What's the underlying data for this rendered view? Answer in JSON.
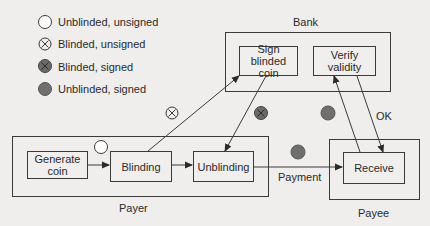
{
  "legend": {
    "items": [
      {
        "symbol": "open-circle",
        "label": "Unblinded, unsigned"
      },
      {
        "symbol": "x-circle",
        "label": "Blinded, unsigned"
      },
      {
        "symbol": "dark-x-circle",
        "label": "Blinded, signed"
      },
      {
        "symbol": "dark-circle",
        "label": "Unblinded, signed"
      }
    ]
  },
  "groups": {
    "bank": {
      "label": "Bank"
    },
    "payer": {
      "label": "Payer"
    },
    "payee": {
      "label": "Payee"
    }
  },
  "nodes": {
    "sign": {
      "line1": "Sign",
      "line2": "blinded coin"
    },
    "verify": {
      "line1": "Verify",
      "line2": "validity"
    },
    "generate": {
      "line1": "Generate",
      "line2": "coin"
    },
    "blinding": {
      "label": "Blinding"
    },
    "unblinding": {
      "label": "Unblinding"
    },
    "receive": {
      "label": "Receive"
    }
  },
  "edges": {
    "payment": {
      "label": "Payment"
    },
    "ok": {
      "label": "OK"
    }
  },
  "colors": {
    "line": "#3a3a3a",
    "dark_fill": "#6f6f6f",
    "background": "#efeeec"
  }
}
